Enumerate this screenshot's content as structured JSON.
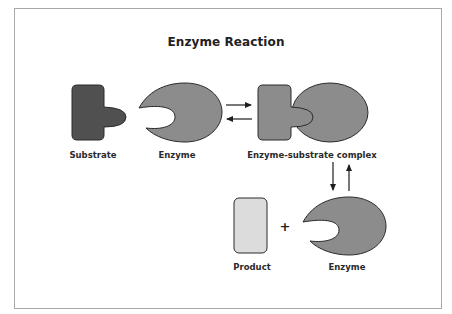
{
  "title": "Enzyme Reaction",
  "labels": {
    "substrate": "Substrate",
    "enzyme": "Enzyme",
    "complex": "Enzyme-substrate complex",
    "product": "Product",
    "enzyme_after": "Enzyme"
  },
  "operator": "+",
  "colors": {
    "substrate_fill": "#505050",
    "enzyme_fill": "#8c8c8c",
    "complex_substrate_fill": "#8c8c8c",
    "product_fill": "#dcdcdc",
    "outline": "#2a2a2a",
    "frame_border": "#a8a8a8"
  },
  "arrows": [
    {
      "name": "forward",
      "direction": "right"
    },
    {
      "name": "reverse",
      "direction": "left"
    },
    {
      "name": "to-products",
      "direction": "down"
    },
    {
      "name": "from-products",
      "direction": "up"
    }
  ]
}
